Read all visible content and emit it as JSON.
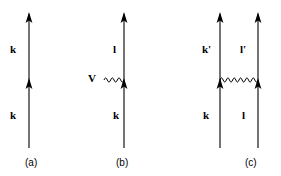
{
  "figure": {
    "background_color": "#ffffff",
    "line_color": "#000000",
    "panels": [
      {
        "id": "a",
        "caption": "(a)",
        "description": "Single upward fermion line with two arrowheads, labelled k above and k below",
        "lines": [
          {
            "name": "fermion-line-a",
            "x": 29,
            "y_top": 14,
            "y_bottom": 148,
            "arrowheads": [
              14,
              85
            ]
          }
        ],
        "labels": [
          {
            "name": "momentum-label-k-upper",
            "text": "k"
          },
          {
            "name": "momentum-label-k-lower",
            "text": "k"
          }
        ]
      },
      {
        "id": "b",
        "caption": "(b)",
        "description": "Single upward fermion line with a wavy interaction line entering from the left at the vertex; wavy line labelled V, outgoing line l, incoming line k",
        "lines": [
          {
            "name": "fermion-line-b",
            "x": 124,
            "y_top": 14,
            "y_bottom": 148,
            "arrowheads": [
              14,
              85
            ]
          }
        ],
        "wavy": {
          "name": "interaction-wavy-line-b",
          "x_start": 104,
          "x_end": 124,
          "y": 80,
          "cycles": 6,
          "amplitude": 3.5
        },
        "labels": [
          {
            "name": "momentum-label-l",
            "text": "l"
          },
          {
            "name": "momentum-label-k",
            "text": "k"
          },
          {
            "name": "interaction-label-v",
            "text": "V"
          }
        ]
      },
      {
        "id": "c",
        "caption": "(c)",
        "description": "Two upward fermion lines joined by a horizontal wavy interaction line; outgoing lines labelled k' and l', incoming lines labelled k and l",
        "lines": [
          {
            "name": "fermion-line-c-left",
            "x": 220,
            "y_top": 14,
            "y_bottom": 148,
            "arrowheads": [
              14,
              85
            ]
          },
          {
            "name": "fermion-line-c-right",
            "x": 258,
            "y_top": 14,
            "y_bottom": 148,
            "arrowheads": [
              14,
              85
            ]
          }
        ],
        "wavy": {
          "name": "interaction-wavy-line-c",
          "x_start": 220,
          "x_end": 258,
          "y": 80,
          "cycles": 6,
          "amplitude": 3.5
        },
        "labels": [
          {
            "name": "momentum-label-k-prime",
            "text": "k'"
          },
          {
            "name": "momentum-label-l-prime",
            "text": "l'"
          },
          {
            "name": "momentum-label-k",
            "text": "k"
          },
          {
            "name": "momentum-label-l",
            "text": "l"
          }
        ]
      }
    ]
  }
}
